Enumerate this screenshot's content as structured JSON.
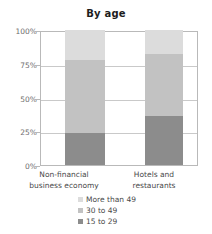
{
  "chart_data": {
    "type": "bar",
    "stacked": true,
    "normalized_percent": true,
    "title": "By age",
    "xlabel": "",
    "ylabel": "",
    "ylim": [
      0,
      100
    ],
    "ytick_labels": [
      "100%",
      "75%",
      "50%",
      "25%",
      "0%"
    ],
    "ytick_values": [
      100,
      75,
      50,
      25,
      0
    ],
    "grid": true,
    "legend_position": "bottom-center",
    "categories": [
      "Non-financial business economy",
      "Hotels and restaurants"
    ],
    "category_lines": [
      [
        "Non-financial",
        "business economy"
      ],
      [
        "Hotels and",
        "restaurants"
      ]
    ],
    "series": [
      {
        "name": "More than 49",
        "color": "#dcdcdc",
        "values": [
          22,
          18
        ]
      },
      {
        "name": "30 to 49",
        "color": "#c2c2c2",
        "values": [
          54,
          46
        ]
      },
      {
        "name": "15 to 29",
        "color": "#8c8c8c",
        "values": [
          24,
          36
        ]
      }
    ],
    "stack_boundaries": {
      "Non-financial business economy": [
        0,
        24,
        78,
        100
      ],
      "Hotels and restaurants": [
        0,
        36,
        82,
        100
      ]
    }
  },
  "colors": {
    "more_than_49": "#dcdcdc",
    "age_30_to_49": "#c2c2c2",
    "age_15_to_29": "#8c8c8c",
    "gridline": "#c9c9c9",
    "axis": "#b9b9b9",
    "text": "#4a4a4a",
    "tick_text": "#6d6d6d",
    "background": "#ffffff"
  }
}
